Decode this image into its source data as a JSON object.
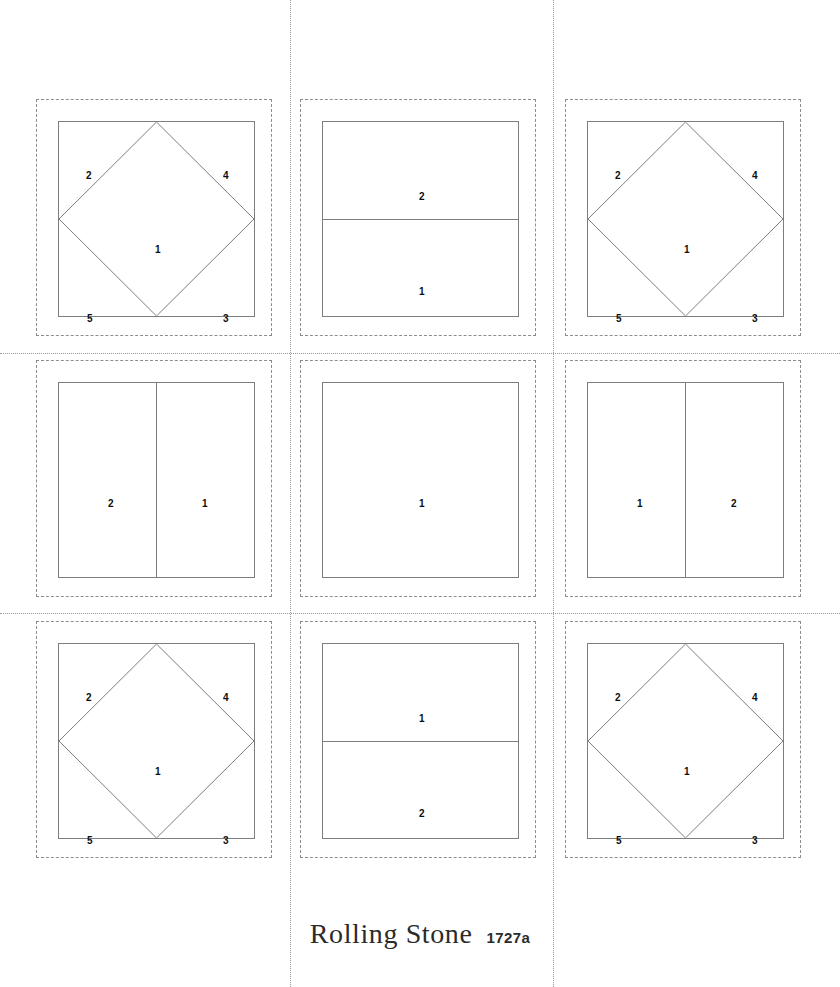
{
  "pattern": {
    "title": "Rolling Stone",
    "code": "1727a"
  },
  "colors": {
    "patch_line": "#7d7d7d",
    "seam_allowance_line": "#8d8d8d",
    "page_guide_line": "#9a9a9a",
    "label_text": "#0d0d0d",
    "background": "#ffffff"
  },
  "page_guides": {
    "vertical": [
      290,
      553
    ],
    "horizontal": [
      353,
      613
    ]
  },
  "grid": {
    "rows": 3,
    "columns": 3
  },
  "blocks": [
    {
      "position": "top-left",
      "type": "square-in-square",
      "left": 36,
      "top": 99,
      "labels": [
        {
          "value": "2",
          "x": 30,
          "y": 54
        },
        {
          "value": "4",
          "x": 167,
          "y": 54
        },
        {
          "value": "1",
          "x": 99,
          "y": 128
        },
        {
          "value": "5",
          "x": 31,
          "y": 197
        },
        {
          "value": "3",
          "x": 167,
          "y": 197
        }
      ]
    },
    {
      "position": "top-center",
      "type": "horizontal-split",
      "left": 300,
      "top": 99,
      "labels": [
        {
          "value": "2",
          "x": 99,
          "y": 75
        },
        {
          "value": "1",
          "x": 99,
          "y": 170
        }
      ]
    },
    {
      "position": "top-right",
      "type": "square-in-square",
      "left": 565,
      "top": 99,
      "labels": [
        {
          "value": "2",
          "x": 30,
          "y": 54
        },
        {
          "value": "4",
          "x": 167,
          "y": 54
        },
        {
          "value": "1",
          "x": 99,
          "y": 128
        },
        {
          "value": "5",
          "x": 31,
          "y": 197
        },
        {
          "value": "3",
          "x": 167,
          "y": 197
        }
      ]
    },
    {
      "position": "middle-left",
      "type": "vertical-split",
      "left": 36,
      "top": 360,
      "labels": [
        {
          "value": "2",
          "x": 52,
          "y": 121
        },
        {
          "value": "1",
          "x": 146,
          "y": 121
        }
      ]
    },
    {
      "position": "middle-center",
      "type": "plain",
      "left": 300,
      "top": 360,
      "labels": [
        {
          "value": "1",
          "x": 99,
          "y": 121
        }
      ]
    },
    {
      "position": "middle-right",
      "type": "vertical-split",
      "left": 565,
      "top": 360,
      "labels": [
        {
          "value": "1",
          "x": 52,
          "y": 121
        },
        {
          "value": "2",
          "x": 146,
          "y": 121
        }
      ]
    },
    {
      "position": "bottom-left",
      "type": "square-in-square",
      "left": 36,
      "top": 621,
      "labels": [
        {
          "value": "2",
          "x": 30,
          "y": 54
        },
        {
          "value": "4",
          "x": 167,
          "y": 54
        },
        {
          "value": "1",
          "x": 99,
          "y": 128
        },
        {
          "value": "5",
          "x": 31,
          "y": 197
        },
        {
          "value": "3",
          "x": 167,
          "y": 197
        }
      ]
    },
    {
      "position": "bottom-center",
      "type": "horizontal-split",
      "left": 300,
      "top": 621,
      "labels": [
        {
          "value": "1",
          "x": 99,
          "y": 75
        },
        {
          "value": "2",
          "x": 99,
          "y": 170
        }
      ]
    },
    {
      "position": "bottom-right",
      "type": "square-in-square",
      "left": 565,
      "top": 621,
      "labels": [
        {
          "value": "2",
          "x": 30,
          "y": 54
        },
        {
          "value": "4",
          "x": 167,
          "y": 54
        },
        {
          "value": "1",
          "x": 99,
          "y": 128
        },
        {
          "value": "5",
          "x": 31,
          "y": 197
        },
        {
          "value": "3",
          "x": 167,
          "y": 197
        }
      ]
    }
  ]
}
